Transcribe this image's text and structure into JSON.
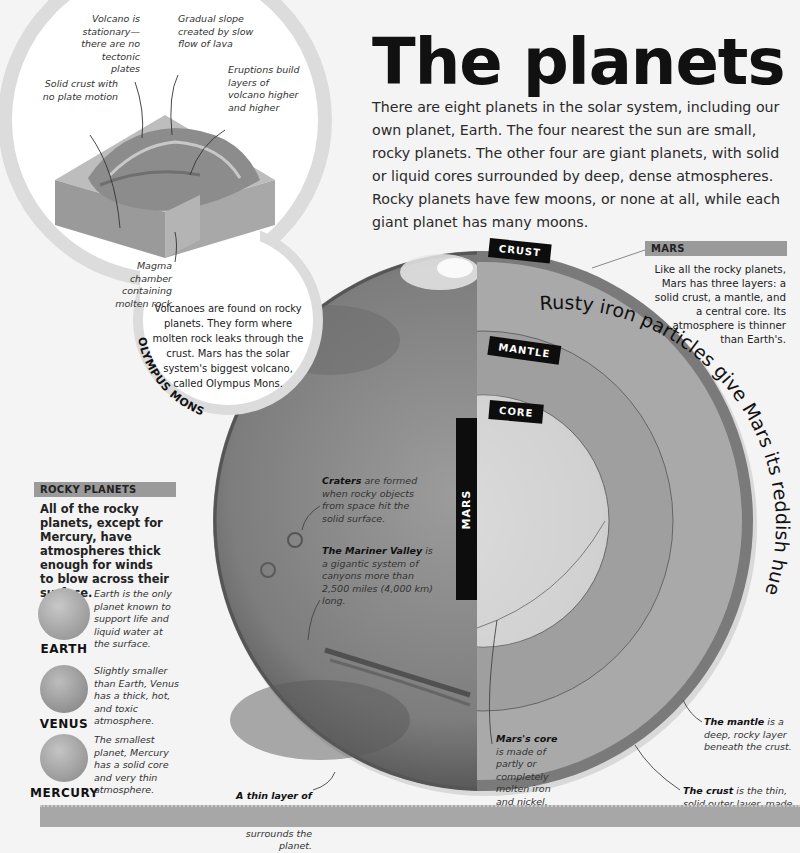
{
  "header": {
    "title": "The planets",
    "intro": "There are eight planets in the solar system, including our own planet, Earth. The four nearest the sun are small, rocky planets. The other four are giant planets, with solid or liquid cores surrounded by deep, dense atmospheres. Rocky planets have few moons, or none at all, while each giant planet has many moons."
  },
  "volcano_diagram": {
    "labels": {
      "stationary": "Volcano is stationary—there are no tectonic plates",
      "slope": "Gradual slope created by slow flow of lava",
      "eruptions": "Eruptions build layers of volcano higher and higher",
      "crust": "Solid crust with no plate motion",
      "magma": "Magma chamber containing molten rock"
    },
    "caption": "Volcanoes are found on rocky planets. They form where molten rock leaks through the crust. Mars has the solar system's biggest volcano, called Olympus Mons.",
    "arc_label": "OLYMPUS MONS"
  },
  "mars": {
    "vertical_label": "MARS",
    "layer_tabs": {
      "crust": "CRUST",
      "mantle": "MANTLE",
      "core": "CORE"
    },
    "curved_text": "Rusty iron particles give Mars its reddish hue",
    "side_box": {
      "header": "MARS",
      "text": "Like all the rocky planets, Mars has three layers: a solid crust, a mantle, and a central core. Its atmosphere is thinner than Earth's."
    },
    "annotations": {
      "craters_bold": "Craters",
      "craters_rest": " are formed when rocky objects from space hit the solid surface.",
      "valley_bold": "The Mariner Valley",
      "valley_rest": " is a gigantic system of canyons more than 2,500 miles (4,000 km) long.",
      "core_bold": "Mars's core",
      "core_rest": " is made of partly or completely molten iron and nickel.",
      "mantle_bold": "The mantle",
      "mantle_rest": " is a deep, rocky layer beneath the crust.",
      "crust_bold": "The crust",
      "crust_rest": " is the thin, solid outer layer, made of rock and dust.",
      "atmo_bold": "A thin layer of gas",
      "atmo_rest": ", called the atmosphere, surrounds the planet."
    }
  },
  "rocky_planets": {
    "header": "ROCKY PLANETS",
    "intro": "All of the rocky planets, except for Mercury, have atmospheres thick enough for winds to blow across their surface.",
    "planets": [
      {
        "name": "EARTH",
        "text": "Earth is the only planet known to support life and liquid water at the surface."
      },
      {
        "name": "VENUS",
        "text": "Slightly smaller than Earth, Venus has a thick, hot, and toxic atmosphere."
      },
      {
        "name": "MERCURY",
        "text": "The smallest planet, Mercury has a solid core and very thin atmosphere."
      }
    ]
  },
  "colors": {
    "background": "#f4f4f4",
    "crust": "#7a7a7a",
    "mantle": "#a9a9a9",
    "core": "#dcdcdc",
    "tab": "#0d0d0d",
    "header_bar": "#9a9a9a"
  }
}
